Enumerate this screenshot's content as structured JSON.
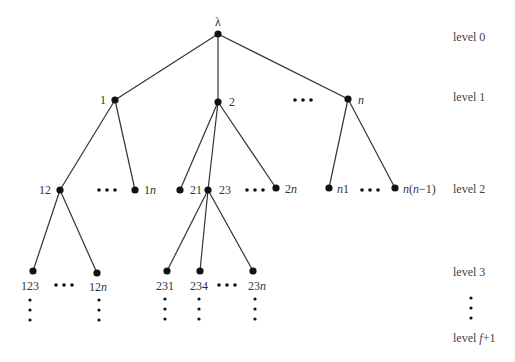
{
  "colors": {
    "edge": "#333333",
    "node": "#111111",
    "text": "#333333"
  },
  "levels": [
    {
      "label": "level 0",
      "y": 41
    },
    {
      "label": "level 1",
      "y": 101
    },
    {
      "label": "level 2",
      "y": 193
    },
    {
      "label": "level 3",
      "y": 276
    },
    {
      "label": "level f+1",
      "y": 342
    }
  ],
  "nodes": [
    {
      "id": "root",
      "label": "λ",
      "x": 218,
      "y": 34,
      "lx": 218,
      "ly": 26,
      "anchor": "middle"
    },
    {
      "id": "n1_1",
      "label": "1",
      "x": 115,
      "y": 100,
      "lx": 106,
      "ly": 104,
      "anchor": "end"
    },
    {
      "id": "n1_2",
      "label": "2",
      "x": 218,
      "y": 102,
      "lx": 229,
      "ly": 106,
      "anchor": "start"
    },
    {
      "id": "n1_n",
      "label": "n",
      "x": 348,
      "y": 99,
      "lx": 358,
      "ly": 104,
      "anchor": "start",
      "italic": true
    },
    {
      "id": "n2_12",
      "label": "12",
      "x": 60,
      "y": 190,
      "lx": 51,
      "ly": 194,
      "anchor": "end"
    },
    {
      "id": "n2_1n",
      "label": "1n",
      "x": 135,
      "y": 190,
      "lx": 144,
      "ly": 194,
      "anchor": "start"
    },
    {
      "id": "n2_21",
      "label": "21",
      "x": 180,
      "y": 190,
      "lx": 190,
      "ly": 194,
      "anchor": "start"
    },
    {
      "id": "n2_23",
      "label": "23",
      "x": 208,
      "y": 190,
      "lx": 219,
      "ly": 194,
      "anchor": "start"
    },
    {
      "id": "n2_2n",
      "label": "2n",
      "x": 276,
      "y": 188,
      "lx": 285,
      "ly": 193,
      "anchor": "start"
    },
    {
      "id": "n2_n1",
      "label": "n1",
      "x": 329,
      "y": 188,
      "lx": 337,
      "ly": 193,
      "anchor": "start"
    },
    {
      "id": "n2_nn1",
      "label": "n(n−1)",
      "x": 395,
      "y": 188,
      "lx": 403,
      "ly": 193,
      "anchor": "start"
    },
    {
      "id": "n3_123",
      "label": "123",
      "x": 33,
      "y": 271,
      "lx": 30,
      "ly": 290,
      "anchor": "middle"
    },
    {
      "id": "n3_12n",
      "label": "12n",
      "x": 97,
      "y": 273,
      "lx": 98,
      "ly": 291,
      "anchor": "middle"
    },
    {
      "id": "n3_231",
      "label": "231",
      "x": 167,
      "y": 271,
      "lx": 165,
      "ly": 290,
      "anchor": "middle"
    },
    {
      "id": "n3_234",
      "label": "234",
      "x": 200,
      "y": 271,
      "lx": 199,
      "ly": 290,
      "anchor": "middle"
    },
    {
      "id": "n3_23n",
      "label": "23n",
      "x": 253,
      "y": 271,
      "lx": 257,
      "ly": 290,
      "anchor": "middle"
    }
  ],
  "edges": [
    [
      "root",
      "n1_1"
    ],
    [
      "root",
      "n1_2"
    ],
    [
      "root",
      "n1_n"
    ],
    [
      "n1_1",
      "n2_12"
    ],
    [
      "n1_1",
      "n2_1n"
    ],
    [
      "n1_2",
      "n2_21"
    ],
    [
      "n1_2",
      "n2_23"
    ],
    [
      "n1_2",
      "n2_2n"
    ],
    [
      "n1_n",
      "n2_n1"
    ],
    [
      "n1_n",
      "n2_nn1"
    ],
    [
      "n2_12",
      "n3_123"
    ],
    [
      "n2_12",
      "n3_12n"
    ],
    [
      "n2_23",
      "n3_231"
    ],
    [
      "n2_23",
      "n3_234"
    ],
    [
      "n2_23",
      "n3_23n"
    ]
  ],
  "h_ellipses": [
    {
      "x": 303,
      "y": 100
    },
    {
      "x": 107,
      "y": 190
    },
    {
      "x": 255,
      "y": 190
    },
    {
      "x": 370,
      "y": 190
    },
    {
      "x": 64,
      "y": 285
    },
    {
      "x": 227,
      "y": 285
    }
  ],
  "v_ellipses": [
    {
      "x": 30,
      "y": 300
    },
    {
      "x": 99,
      "y": 300
    },
    {
      "x": 165,
      "y": 299
    },
    {
      "x": 199,
      "y": 299
    },
    {
      "x": 255,
      "y": 299
    },
    {
      "x": 471,
      "y": 298
    }
  ]
}
